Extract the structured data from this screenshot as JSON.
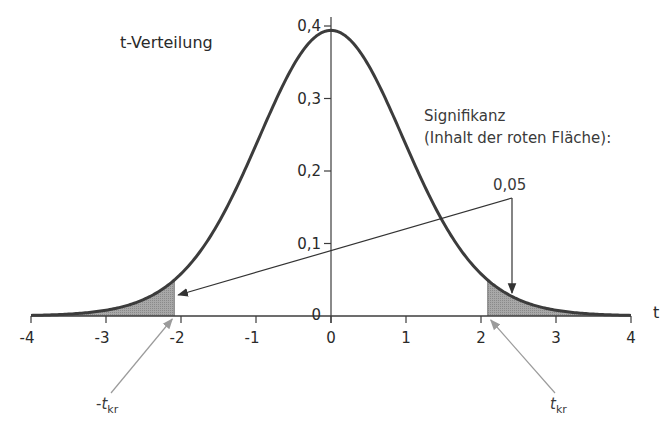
{
  "chart_data": {
    "type": "area",
    "title": "t-Verteilung",
    "xlabel": "t",
    "ylabel": "",
    "distribution": "Student t",
    "degrees_of_freedom": 20,
    "xlim": [
      -4,
      4
    ],
    "ylim": [
      0,
      0.4
    ],
    "x_ticks": [
      -4,
      -3,
      -2,
      -1,
      0,
      1,
      2,
      3,
      4
    ],
    "x_tick_labels": [
      "-4",
      "-3",
      "-2",
      "-1",
      "0",
      "1",
      "2",
      "3",
      "4"
    ],
    "y_ticks": [
      0,
      0.1,
      0.2,
      0.3,
      0.4
    ],
    "y_tick_labels": [
      "0",
      "0,1",
      "0,2",
      "0,3",
      "0,4"
    ],
    "grid": false,
    "peak_density": 0.394,
    "critical_value": 2.09,
    "shaded_regions": [
      {
        "from": -4,
        "to": -2.09,
        "label": "-t_kr"
      },
      {
        "from": 2.09,
        "to": 4,
        "label": "t_kr"
      }
    ],
    "significance_label_line1": "Signifikanz",
    "significance_label_line2": "(Inhalt der roten Fläche):",
    "significance_value": "0,05",
    "critical_labels": {
      "left": {
        "prefix": "-",
        "main": "t",
        "sub": "kr"
      },
      "right": {
        "prefix": "",
        "main": "t",
        "sub": "kr"
      }
    },
    "colors": {
      "curve": "#3c3c3c",
      "axis": "#3c3c3c",
      "shade": "#9a9a9a",
      "pointer_arrow": "#9b9b9b",
      "annotation_arrow": "#333333"
    }
  }
}
